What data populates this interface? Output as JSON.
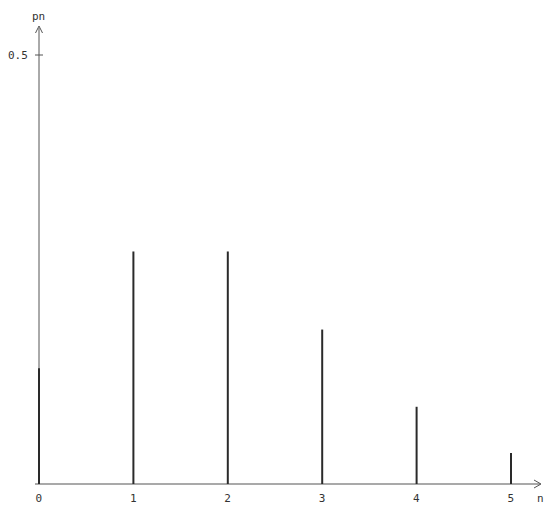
{
  "chart_data": {
    "type": "bar",
    "style": "stem",
    "title": "",
    "xlabel": "n",
    "ylabel": "p_n",
    "ylabel_display": "pn",
    "categories": [
      "0",
      "1",
      "2",
      "3",
      "4",
      "5"
    ],
    "x": [
      0,
      1,
      2,
      3,
      4,
      5
    ],
    "values": [
      0.135,
      0.271,
      0.271,
      0.18,
      0.09,
      0.036
    ],
    "ylim": [
      0,
      0.52
    ],
    "xlim": [
      0,
      5.25
    ],
    "yticks": [
      0.5
    ],
    "ytick_labels": [
      "0.5"
    ],
    "xticks": [
      0,
      1,
      2,
      3,
      4,
      5
    ],
    "xtick_labels": [
      "0",
      "1",
      "2",
      "3",
      "4",
      "5"
    ],
    "grid": false,
    "legend": null,
    "colors": {
      "bars": "#2a2a2a",
      "axis": "#555555"
    }
  }
}
